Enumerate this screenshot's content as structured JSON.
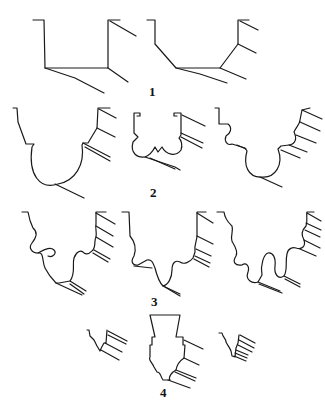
{
  "figure": {
    "type": "diagram",
    "stroke_color": "#1a1a1a",
    "background_color": "#ffffff",
    "groups": [
      {
        "label": "1",
        "profile_count": 2,
        "profiles": [
          "rectangular-step-profile",
          "chamfered-step-profile"
        ]
      },
      {
        "label": "2",
        "profile_count": 3,
        "profiles": [
          "large-cove-profile",
          "double-ovolo-profile",
          "cove-with-fillets-profile"
        ]
      },
      {
        "label": "3",
        "profile_count": 3,
        "profiles": [
          "wavy-cyma-profile-a",
          "wavy-cyma-profile-b",
          "wavy-cyma-profile-c"
        ]
      },
      {
        "label": "4",
        "profile_count": 3,
        "profiles": [
          "small-stepped-profile-left",
          "base-block-profile",
          "small-stepped-profile-right"
        ]
      }
    ]
  }
}
